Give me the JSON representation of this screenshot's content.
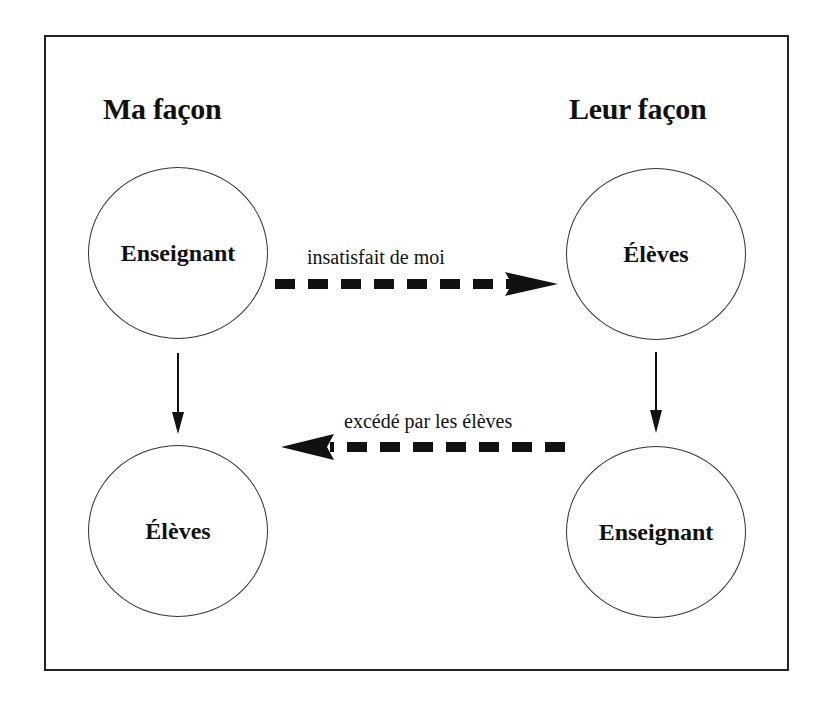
{
  "diagram": {
    "left_column": {
      "heading": "Ma façon",
      "top_node": "Enseignant",
      "bottom_node": "Élèves"
    },
    "right_column": {
      "heading": "Leur façon",
      "top_node": "Élèves",
      "bottom_node": "Enseignant"
    },
    "edges": [
      {
        "from": "left.top_node",
        "to": "right.top_node",
        "label": "insatisfait de moi",
        "style": "dashed-thick",
        "direction": "right"
      },
      {
        "from": "right.bottom_node",
        "to": "left.bottom_node",
        "label": "excédé par les élèves",
        "style": "dashed-thick",
        "direction": "left"
      },
      {
        "from": "left.top_node",
        "to": "left.bottom_node",
        "label": "",
        "style": "solid",
        "direction": "down"
      },
      {
        "from": "right.top_node",
        "to": "right.bottom_node",
        "label": "",
        "style": "solid",
        "direction": "down"
      }
    ]
  }
}
